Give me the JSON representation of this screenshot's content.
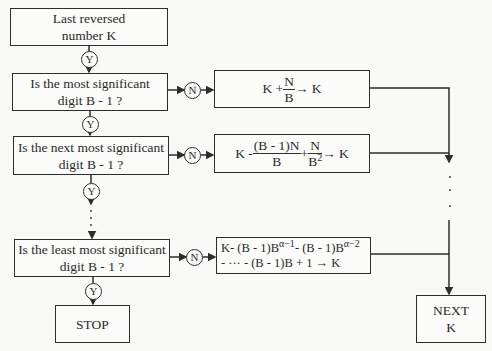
{
  "boxes": {
    "start": {
      "line1": "Last reversed",
      "line2": "number K"
    },
    "q1": {
      "line1": "Is the most significant",
      "line2": "digit B - 1 ?"
    },
    "q2": {
      "line1": "Is the next most significant",
      "line2": "digit B - 1 ?"
    },
    "q3": {
      "line1": "Is the least most significant",
      "line2": "digit B - 1 ?"
    },
    "stop": {
      "label": "STOP"
    },
    "next": {
      "line1": "NEXT",
      "line2": "K"
    }
  },
  "decisions": {
    "yes": "Y",
    "no": "N"
  },
  "formulas": {
    "f1": {
      "left": "K + ",
      "num": "N",
      "den": "B",
      "right": " → K"
    },
    "f2": {
      "left": "K - ",
      "num1": "(B - 1)N",
      "den1": "B",
      "mid": " + ",
      "num2": "N",
      "den2": "B",
      "den2_exp": "2",
      "right": " → K"
    },
    "f3": {
      "line1_a": "K- (B - 1)B",
      "exp1": "α−1",
      "line1_b": "- (B - 1)B",
      "exp2": "α−2",
      "line2": "- ··· -  (B - 1)B + 1 → K"
    }
  },
  "ellipsis": "·"
}
